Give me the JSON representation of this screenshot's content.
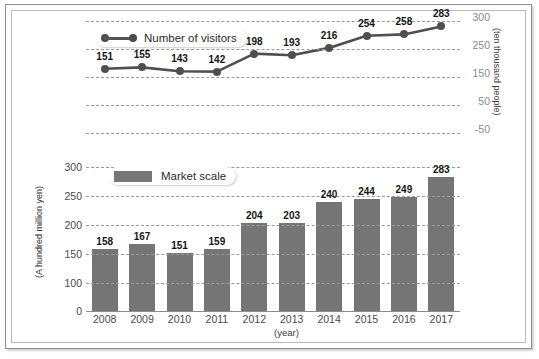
{
  "chart_data": {
    "type": "bar",
    "title": "",
    "categories": [
      "2008",
      "2009",
      "2010",
      "2011",
      "2012",
      "2013",
      "2014",
      "2015",
      "2016",
      "2017"
    ],
    "xlabel": "(year)",
    "grid": true,
    "legend_position": "inside-top-left",
    "series": [
      {
        "name": "Number of visitors",
        "type": "line",
        "values": [
          151,
          155,
          143,
          142,
          198,
          193,
          216,
          254,
          258,
          283
        ],
        "axis": "right",
        "ylabel": "(ten thousand people)",
        "yticks": [
          300,
          250,
          150,
          50,
          -50
        ],
        "ylim": [
          -50,
          300
        ],
        "color": "#4f4f4f"
      },
      {
        "name": "Market scale",
        "type": "bar",
        "values": [
          158,
          167,
          151,
          159,
          204,
          203,
          240,
          244,
          249,
          283
        ],
        "axis": "left",
        "ylabel": "(A hundred million yen)",
        "yticks": [
          300,
          250,
          200,
          150,
          100,
          0
        ],
        "ylim": [
          0,
          300
        ],
        "color": "#757575"
      }
    ]
  },
  "line_chart": {
    "legend_label": "Number of visitors",
    "axis_title": "(ten thousand people)",
    "yticks": [
      "300",
      "250",
      "150",
      "50",
      "-50"
    ],
    "point_labels": [
      "151",
      "155",
      "143",
      "142",
      "198",
      "193",
      "216",
      "254",
      "258",
      "283"
    ]
  },
  "bar_chart": {
    "legend_label": "Market scale",
    "axis_title": "(A hundred million yen)",
    "yticks": [
      "300",
      "250",
      "200",
      "150",
      "100",
      "0"
    ],
    "xticks": [
      "2008",
      "2009",
      "2010",
      "2011",
      "2012",
      "2013",
      "2014",
      "2015",
      "2016",
      "2017"
    ],
    "xaxis_title": "(year)",
    "bar_labels": [
      "158",
      "167",
      "151",
      "159",
      "204",
      "203",
      "240",
      "244",
      "249",
      "283"
    ]
  },
  "colors": {
    "bar": "#757575",
    "line": "#4f4f4f",
    "grid": "#9a9a9a",
    "frame": "#8d8d8d",
    "background": "#ffffff"
  }
}
